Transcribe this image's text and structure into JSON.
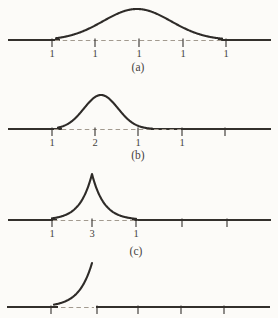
{
  "figure": {
    "width": 278,
    "height": 318,
    "colors": {
      "background": "#fcfbf8",
      "curve": "#2e2b28",
      "axis": "#33302c",
      "dash": "#a29a8f",
      "text": "#45423e"
    }
  },
  "chart_data": {
    "type": "line",
    "title": "",
    "xlabel": "",
    "ylabel": "",
    "panels": [
      {
        "caption": "(a)",
        "shape": "gaussian",
        "baseline_y": 40,
        "center_x": 137,
        "peak_top_y": 9,
        "sigma": 34,
        "curve_span": [
          56,
          222
        ],
        "dash_span": [
          55,
          224
        ],
        "solid_segments": [
          [
            8,
            60
          ],
          [
            218,
            271
          ]
        ],
        "ticks": [
          52,
          95,
          139,
          183,
          226
        ],
        "tick_labels": [
          "1",
          "1",
          "1",
          "1",
          "1"
        ],
        "caption_x": 138,
        "caption_y": 71
      },
      {
        "caption": "(b)",
        "shape": "gaussian",
        "baseline_y": 129,
        "center_x": 101,
        "peak_top_y": 95,
        "sigma": 17,
        "curve_span": [
          58,
          152
        ],
        "dash_span": [
          54,
          181
        ],
        "solid_segments": [
          [
            8,
            62
          ],
          [
            148,
            271
          ]
        ],
        "ticks": [
          52,
          95,
          138,
          182,
          225
        ],
        "tick_labels": [
          "1",
          "2",
          "1",
          "1",
          ""
        ],
        "caption_x": 138,
        "caption_y": 159
      },
      {
        "caption": "(c)",
        "shape": "exp_cusp",
        "baseline_y": 220,
        "center_x": 92,
        "peak_top_y": 174,
        "width": 12,
        "curve_span": [
          52,
          136
        ],
        "dash_span": [
          53,
          138
        ],
        "solid_segments": [
          [
            8,
            57
          ],
          [
            132,
            271
          ]
        ],
        "ticks": [
          52,
          92,
          136,
          182,
          227
        ],
        "tick_labels": [
          "1",
          "3",
          "1",
          "",
          ""
        ],
        "caption_x": 136,
        "caption_y": 255
      },
      {
        "caption": "",
        "shape": "exp_rise",
        "baseline_y": 307,
        "end_x": 92,
        "end_y": 263,
        "width": 13,
        "curve_span": [
          54,
          92
        ],
        "dash_span": [
          61,
          94
        ],
        "solid_segments": [
          [
            7,
            58
          ],
          [
            96,
            270
          ]
        ],
        "ticks": [
          51,
          97,
          138,
          181,
          224
        ],
        "tick_labels": [
          "",
          "",
          "",
          "",
          ""
        ],
        "caption_x": 138,
        "caption_y": 330
      }
    ]
  }
}
